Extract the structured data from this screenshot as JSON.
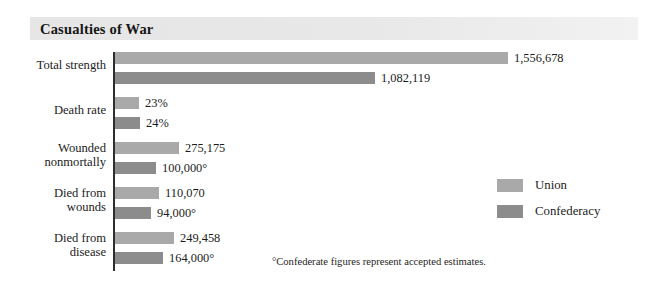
{
  "title": "Casualties of War",
  "footnote": "°Confederate figures represent accepted estimates.",
  "legend": {
    "items": [
      {
        "label": "Union",
        "color": "#a9a9a9"
      },
      {
        "label": "Confederacy",
        "color": "#8c8c8c"
      }
    ]
  },
  "chart_data": {
    "type": "bar",
    "title": "Casualties of War",
    "orientation": "horizontal",
    "xlabel": "",
    "ylabel": "",
    "grid": false,
    "legend_position": "right",
    "axis_line": true,
    "categories": [
      "Total strength",
      "Death rate",
      "Wounded\nnonmortally",
      "Died from\nwounds",
      "Died from\ndisease"
    ],
    "series": [
      {
        "name": "Union",
        "color": "#a9a9a9",
        "values": [
          1556678,
          23,
          275175,
          110070,
          249458
        ],
        "labels": [
          "1,556,678",
          "23%",
          "275,175",
          "110,070",
          "249,458"
        ]
      },
      {
        "name": "Confederacy",
        "color": "#8c8c8c",
        "values": [
          1082119,
          24,
          100000,
          94000,
          164000
        ],
        "labels": [
          "1,082,119",
          "24%",
          "100,000°",
          "94,000°",
          "164,000°"
        ]
      }
    ],
    "annotations": [
      "°Confederate figures represent accepted estimates."
    ]
  },
  "groups": [
    {
      "label": "Total strength",
      "top": 0,
      "label_top": 8,
      "bars": [
        {
          "series": "Union",
          "value_label": "1,556,678",
          "width": 393,
          "top": 2
        },
        {
          "series": "Confederacy",
          "value_label": "1,082,119",
          "width": 260,
          "top": 22
        }
      ]
    },
    {
      "label": "Death rate",
      "top": 45,
      "label_top": 8,
      "bars": [
        {
          "series": "Union",
          "value_label": "23%",
          "width": 24,
          "top": 2
        },
        {
          "series": "Confederacy",
          "value_label": "24%",
          "width": 25,
          "top": 22
        }
      ]
    },
    {
      "label": "Wounded\nnonmortally",
      "top": 90,
      "label_top": 1,
      "bars": [
        {
          "series": "Union",
          "value_label": "275,175",
          "width": 64,
          "top": 2
        },
        {
          "series": "Confederacy",
          "value_label": "100,000°",
          "width": 41,
          "top": 22
        }
      ]
    },
    {
      "label": "Died from\nwounds",
      "top": 135,
      "label_top": 1,
      "bars": [
        {
          "series": "Union",
          "value_label": "110,070",
          "width": 44,
          "top": 2
        },
        {
          "series": "Confederacy",
          "value_label": "94,000°",
          "width": 36,
          "top": 22
        }
      ]
    },
    {
      "label": "Died from\ndisease",
      "top": 180,
      "label_top": 1,
      "bars": [
        {
          "series": "Union",
          "value_label": "249,458",
          "width": 59,
          "top": 2
        },
        {
          "series": "Confederacy",
          "value_label": "164,000°",
          "width": 48,
          "top": 22
        }
      ]
    }
  ]
}
